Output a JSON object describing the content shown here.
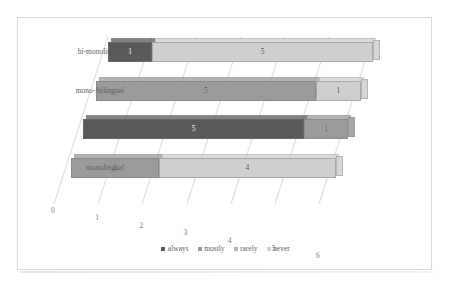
{
  "chart_data": {
    "type": "bar",
    "title": "",
    "subtitle": "",
    "xlabel": "",
    "ylabel": "",
    "orientation": "horizontal",
    "stacked": true,
    "three_d": true,
    "grid": true,
    "legend_position": "bottom",
    "xlim": [
      0,
      6
    ],
    "xticks": [
      "0",
      "1",
      "2",
      "3",
      "4",
      "5",
      "6"
    ],
    "categories": [
      "monolingual",
      "bilingual",
      "mono-/bilingual",
      "bi-monolingual"
    ],
    "categories_display_order_top_to_bottom": [
      "bi-monolingual",
      "mono-/bilingual",
      "bilingual",
      "monolingual"
    ],
    "series": [
      {
        "name": "always",
        "color": "#5a5a5a",
        "values": [
          0,
          5,
          0,
          1
        ]
      },
      {
        "name": "mostly",
        "color": "#9a9a9a",
        "values": [
          2,
          1,
          5,
          0
        ]
      },
      {
        "name": "rarely",
        "color": "#b5b5b5",
        "values": [
          0,
          0,
          0,
          0
        ]
      },
      {
        "name": "never",
        "color": "#cfcfcf",
        "values": [
          4,
          0,
          1,
          5
        ]
      }
    ],
    "bars": [
      {
        "category": "bi-monolingual",
        "segments": [
          {
            "series": "always",
            "value": 1,
            "label": "1",
            "color": "#5a5a5a"
          },
          {
            "series": "never",
            "value": 5,
            "label": "5",
            "color": "#cfcfcf"
          }
        ]
      },
      {
        "category": "mono-/bilingual",
        "segments": [
          {
            "series": "mostly",
            "value": 5,
            "label": "5",
            "color": "#9a9a9a"
          },
          {
            "series": "never",
            "value": 1,
            "label": "1",
            "color": "#cfcfcf"
          }
        ]
      },
      {
        "category": "bilingual",
        "segments": [
          {
            "series": "always",
            "value": 5,
            "label": "5",
            "color": "#5a5a5a"
          },
          {
            "series": "mostly",
            "value": 1,
            "label": "1",
            "color": "#9a9a9a"
          }
        ]
      },
      {
        "category": "monolingual",
        "segments": [
          {
            "series": "mostly",
            "value": 2,
            "label": "2",
            "color": "#9a9a9a"
          },
          {
            "series": "never",
            "value": 4,
            "label": "4",
            "color": "#cfcfcf"
          }
        ]
      }
    ],
    "legend": [
      {
        "label": "always",
        "color": "#5a5a5a"
      },
      {
        "label": "mostly",
        "color": "#9a9a9a"
      },
      {
        "label": "rarely",
        "color": "#b5b5b5"
      },
      {
        "label": "never",
        "color": "#cfcfcf"
      }
    ]
  },
  "colors": {
    "frame_border": "#d9d9d9",
    "gridline": "#eceff1",
    "text": "#5e5e5e",
    "background": "#ffffff"
  }
}
